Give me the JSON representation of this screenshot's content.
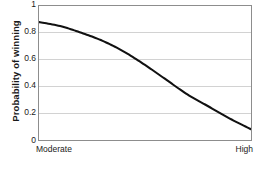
{
  "chart_data": {
    "type": "line",
    "title": "",
    "xlabel": "",
    "ylabel": "Probability of winning",
    "ylim": [
      0,
      1
    ],
    "yticks": [
      "1",
      "0.8",
      "0.6",
      "0.4",
      "0.2",
      "0"
    ],
    "ytick_values": [
      1,
      0.8,
      0.6,
      0.4,
      0.2,
      0
    ],
    "xtick_labels": [
      "Moderate",
      "High"
    ],
    "grid": "horizontal",
    "legend": "none",
    "series": [
      {
        "name": "Probability of winning",
        "x": [
          0,
          0.1,
          0.2,
          0.3,
          0.4,
          0.5,
          0.6,
          0.7,
          0.8,
          0.9,
          1.0
        ],
        "values": [
          0.88,
          0.85,
          0.8,
          0.74,
          0.66,
          0.56,
          0.45,
          0.34,
          0.25,
          0.16,
          0.08
        ]
      }
    ],
    "line_color": "#111111",
    "grid_color": "#d2d2d2",
    "frame_color": "#8d8d8d"
  },
  "axes": {
    "y_title": "Probability of winning",
    "y_ticks": [
      {
        "label": "1",
        "value": 1.0
      },
      {
        "label": "0.8",
        "value": 0.8
      },
      {
        "label": "0.6",
        "value": 0.6
      },
      {
        "label": "0.4",
        "value": 0.4
      },
      {
        "label": "0.2",
        "value": 0.2
      },
      {
        "label": "0",
        "value": 0.0
      }
    ],
    "x_ticks": [
      {
        "label": "Moderate",
        "position": "left"
      },
      {
        "label": "High",
        "position": "right"
      }
    ]
  },
  "caption": {
    "text": ""
  }
}
